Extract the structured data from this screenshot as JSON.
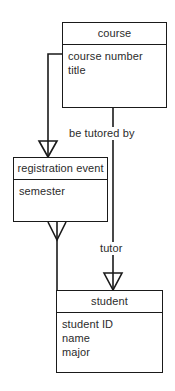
{
  "diagram": {
    "type": "uml-class-diagram",
    "background_color": "#ffffff",
    "line_color": "#1a1a1a",
    "text_color": "#2b2b2b",
    "classes": [
      {
        "id": "course",
        "name": "course",
        "attributes": [
          "course number",
          "title"
        ]
      },
      {
        "id": "registration_event",
        "name": "registration event",
        "attributes": [
          "semester"
        ]
      },
      {
        "id": "student",
        "name": "student",
        "attributes": [
          "student ID",
          "name",
          "major"
        ]
      }
    ],
    "relationship_labels": {
      "be_tutored_by": "be tutored by",
      "tutor": "tutor"
    },
    "connectors": [
      {
        "from": "course",
        "to": "registration_event",
        "marker": "hollow-triangle",
        "marker_at": "registration_event",
        "label": ""
      },
      {
        "from": "registration_event",
        "to": "student",
        "marker": "open-arrow",
        "marker_at": "student",
        "label": ""
      },
      {
        "from": "course",
        "to": "student",
        "marker": "hollow-triangle",
        "marker_at": "student",
        "label": "be tutored by / tutor"
      }
    ]
  }
}
